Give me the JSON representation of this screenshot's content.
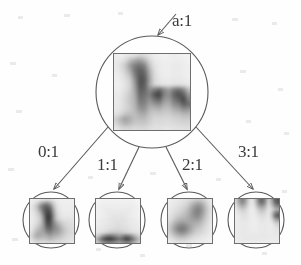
{
  "figure": {
    "type": "tree-diagram",
    "background_color": "#fefefe",
    "ink_color": "#4a4a4a"
  },
  "root": {
    "id": "root",
    "label": "a:1",
    "label_x": 172,
    "label_y": 12,
    "center_x": 152,
    "center_y": 92,
    "radius": 56,
    "patch": {
      "x": 113,
      "y": 53,
      "size": 78,
      "cells": 16,
      "values": [
        [
          12,
          10,
          14,
          18,
          22,
          30,
          26,
          18,
          12,
          10,
          8,
          10,
          12,
          10,
          8,
          8
        ],
        [
          14,
          16,
          26,
          48,
          64,
          72,
          55,
          30,
          16,
          12,
          10,
          10,
          12,
          12,
          10,
          8
        ],
        [
          16,
          22,
          40,
          72,
          96,
          104,
          88,
          44,
          20,
          14,
          12,
          12,
          14,
          14,
          12,
          10
        ],
        [
          14,
          20,
          36,
          66,
          104,
          120,
          106,
          58,
          24,
          14,
          12,
          12,
          14,
          14,
          12,
          10
        ],
        [
          12,
          16,
          28,
          50,
          96,
          126,
          118,
          66,
          28,
          16,
          12,
          12,
          14,
          14,
          12,
          10
        ],
        [
          10,
          14,
          22,
          38,
          84,
          130,
          124,
          70,
          30,
          18,
          14,
          14,
          16,
          16,
          14,
          12
        ],
        [
          10,
          12,
          20,
          34,
          76,
          128,
          120,
          68,
          34,
          26,
          22,
          20,
          24,
          26,
          22,
          16
        ],
        [
          12,
          14,
          22,
          36,
          70,
          120,
          116,
          86,
          96,
          110,
          86,
          72,
          96,
          104,
          86,
          48
        ],
        [
          14,
          16,
          26,
          40,
          66,
          112,
          108,
          96,
          128,
          140,
          96,
          84,
          116,
          132,
          118,
          76
        ],
        [
          14,
          18,
          28,
          42,
          62,
          104,
          100,
          84,
          108,
          118,
          82,
          76,
          104,
          120,
          136,
          96
        ],
        [
          14,
          18,
          28,
          40,
          58,
          92,
          92,
          70,
          78,
          84,
          64,
          62,
          84,
          96,
          120,
          108
        ],
        [
          16,
          20,
          30,
          40,
          54,
          78,
          80,
          56,
          54,
          58,
          48,
          48,
          62,
          70,
          86,
          80
        ],
        [
          20,
          28,
          44,
          48,
          50,
          62,
          64,
          46,
          38,
          40,
          36,
          36,
          44,
          48,
          56,
          54
        ],
        [
          34,
          52,
          68,
          60,
          48,
          50,
          50,
          38,
          30,
          30,
          28,
          28,
          32,
          34,
          38,
          38
        ],
        [
          28,
          44,
          56,
          50,
          40,
          40,
          40,
          32,
          26,
          26,
          24,
          24,
          26,
          28,
          30,
          30
        ],
        [
          16,
          24,
          30,
          30,
          26,
          28,
          28,
          24,
          20,
          20,
          18,
          18,
          20,
          20,
          22,
          22
        ]
      ]
    }
  },
  "children": [
    {
      "id": "child-0",
      "edge_label": "0:1",
      "edge_label_x": 38,
      "edge_label_y": 143,
      "center_x": 51,
      "center_y": 220,
      "radius": 28,
      "patch": {
        "x": 29,
        "y": 198,
        "size": 46,
        "cells": 14,
        "values": [
          [
            10,
            12,
            14,
            18,
            22,
            26,
            22,
            16,
            12,
            10,
            10,
            10,
            10,
            10
          ],
          [
            12,
            18,
            32,
            52,
            70,
            78,
            60,
            34,
            18,
            12,
            10,
            10,
            10,
            10
          ],
          [
            14,
            26,
            48,
            84,
            110,
            118,
            96,
            50,
            22,
            14,
            12,
            12,
            12,
            12
          ],
          [
            14,
            24,
            44,
            80,
            116,
            132,
            118,
            64,
            26,
            16,
            12,
            12,
            12,
            12
          ],
          [
            12,
            20,
            34,
            62,
            108,
            140,
            132,
            74,
            32,
            18,
            14,
            14,
            14,
            14
          ],
          [
            12,
            18,
            28,
            48,
            96,
            146,
            140,
            82,
            36,
            20,
            16,
            16,
            16,
            16
          ],
          [
            12,
            16,
            26,
            42,
            88,
            144,
            138,
            84,
            42,
            28,
            22,
            20,
            20,
            18
          ],
          [
            12,
            18,
            28,
            44,
            84,
            136,
            132,
            92,
            62,
            44,
            32,
            26,
            24,
            20
          ],
          [
            14,
            22,
            36,
            52,
            82,
            124,
            124,
            96,
            76,
            56,
            40,
            30,
            26,
            22
          ],
          [
            16,
            28,
            46,
            60,
            78,
            108,
            112,
            92,
            80,
            64,
            46,
            34,
            28,
            24
          ],
          [
            20,
            38,
            58,
            64,
            70,
            88,
            94,
            80,
            72,
            60,
            46,
            34,
            28,
            24
          ],
          [
            26,
            46,
            62,
            60,
            58,
            66,
            72,
            62,
            56,
            48,
            38,
            30,
            26,
            22
          ],
          [
            22,
            36,
            46,
            46,
            44,
            48,
            52,
            46,
            40,
            36,
            30,
            26,
            22,
            20
          ],
          [
            14,
            20,
            26,
            26,
            26,
            28,
            30,
            28,
            26,
            24,
            22,
            20,
            18,
            16
          ]
        ]
      }
    },
    {
      "id": "child-1",
      "edge_label": "1:1",
      "edge_label_x": 97,
      "edge_label_y": 156,
      "center_x": 117,
      "center_y": 220,
      "radius": 28,
      "patch": {
        "x": 95,
        "y": 198,
        "size": 46,
        "cells": 14,
        "values": [
          [
            6,
            6,
            8,
            8,
            8,
            8,
            8,
            8,
            8,
            8,
            8,
            8,
            6,
            6
          ],
          [
            6,
            8,
            10,
            10,
            10,
            10,
            10,
            10,
            10,
            10,
            10,
            10,
            8,
            6
          ],
          [
            8,
            10,
            12,
            12,
            12,
            12,
            12,
            12,
            12,
            12,
            12,
            12,
            10,
            8
          ],
          [
            8,
            10,
            12,
            14,
            14,
            14,
            14,
            14,
            14,
            14,
            14,
            12,
            10,
            8
          ],
          [
            8,
            10,
            12,
            14,
            16,
            16,
            16,
            16,
            16,
            16,
            14,
            12,
            10,
            8
          ],
          [
            8,
            10,
            12,
            14,
            16,
            18,
            18,
            18,
            18,
            16,
            14,
            12,
            10,
            8
          ],
          [
            10,
            12,
            14,
            16,
            18,
            20,
            20,
            20,
            20,
            18,
            16,
            14,
            12,
            10
          ],
          [
            10,
            12,
            14,
            16,
            18,
            20,
            22,
            22,
            20,
            18,
            16,
            14,
            12,
            10
          ],
          [
            12,
            14,
            16,
            18,
            20,
            22,
            24,
            24,
            22,
            20,
            18,
            16,
            14,
            12
          ],
          [
            14,
            16,
            18,
            20,
            24,
            26,
            28,
            28,
            26,
            24,
            20,
            18,
            16,
            14
          ],
          [
            18,
            22,
            28,
            34,
            40,
            44,
            44,
            42,
            38,
            34,
            30,
            26,
            22,
            18
          ],
          [
            34,
            52,
            78,
            96,
            104,
            98,
            86,
            76,
            88,
            100,
            92,
            70,
            48,
            32
          ],
          [
            56,
            88,
            120,
            140,
            146,
            136,
            118,
            106,
            120,
            138,
            130,
            102,
            72,
            48
          ],
          [
            40,
            62,
            84,
            96,
            100,
            94,
            84,
            76,
            84,
            96,
            90,
            72,
            52,
            34
          ]
        ]
      }
    },
    {
      "id": "child-2",
      "edge_label": "2:1",
      "edge_label_x": 182,
      "edge_label_y": 156,
      "center_x": 189,
      "center_y": 220,
      "radius": 28,
      "patch": {
        "x": 167,
        "y": 198,
        "size": 46,
        "cells": 14,
        "values": [
          [
            10,
            12,
            14,
            16,
            18,
            20,
            24,
            30,
            36,
            40,
            38,
            30,
            20,
            14
          ],
          [
            12,
            14,
            16,
            18,
            22,
            26,
            34,
            46,
            58,
            64,
            58,
            42,
            26,
            16
          ],
          [
            12,
            16,
            18,
            22,
            26,
            32,
            44,
            60,
            76,
            84,
            74,
            52,
            32,
            18
          ],
          [
            14,
            18,
            22,
            26,
            32,
            40,
            52,
            70,
            86,
            94,
            82,
            58,
            36,
            20
          ],
          [
            16,
            20,
            26,
            32,
            38,
            46,
            58,
            74,
            88,
            94,
            80,
            56,
            34,
            20
          ],
          [
            18,
            24,
            32,
            40,
            46,
            52,
            62,
            74,
            84,
            86,
            72,
            50,
            32,
            18
          ],
          [
            22,
            30,
            42,
            52,
            58,
            60,
            64,
            70,
            74,
            74,
            62,
            44,
            28,
            18
          ],
          [
            28,
            40,
            56,
            68,
            74,
            72,
            68,
            66,
            64,
            60,
            50,
            36,
            24,
            16
          ],
          [
            34,
            50,
            70,
            86,
            92,
            88,
            76,
            66,
            56,
            50,
            42,
            30,
            22,
            14
          ],
          [
            36,
            54,
            76,
            94,
            100,
            94,
            78,
            62,
            48,
            40,
            34,
            26,
            20,
            14
          ],
          [
            32,
            46,
            64,
            80,
            86,
            80,
            66,
            52,
            40,
            32,
            28,
            22,
            18,
            12
          ],
          [
            24,
            34,
            46,
            56,
            60,
            56,
            46,
            36,
            28,
            24,
            20,
            18,
            14,
            12
          ],
          [
            16,
            22,
            30,
            36,
            38,
            36,
            30,
            24,
            20,
            18,
            16,
            14,
            12,
            10
          ],
          [
            10,
            14,
            18,
            20,
            22,
            20,
            18,
            16,
            14,
            12,
            12,
            10,
            10,
            8
          ]
        ]
      }
    },
    {
      "id": "child-3",
      "edge_label": "3:1",
      "edge_label_x": 238,
      "edge_label_y": 143,
      "center_x": 256,
      "center_y": 220,
      "radius": 28,
      "patch": {
        "x": 234,
        "y": 198,
        "size": 46,
        "cells": 14,
        "values": [
          [
            34,
            72,
            96,
            74,
            34,
            18,
            46,
            96,
            118,
            90,
            40,
            70,
            120,
            132
          ],
          [
            30,
            62,
            86,
            66,
            30,
            16,
            40,
            86,
            106,
            80,
            34,
            60,
            108,
            124
          ],
          [
            22,
            44,
            60,
            48,
            24,
            14,
            30,
            62,
            76,
            58,
            26,
            44,
            80,
            96
          ],
          [
            16,
            28,
            38,
            32,
            18,
            12,
            20,
            40,
            50,
            40,
            20,
            30,
            56,
            70
          ],
          [
            14,
            20,
            26,
            24,
            16,
            12,
            16,
            28,
            34,
            28,
            18,
            40,
            90,
            110
          ],
          [
            12,
            16,
            20,
            20,
            16,
            12,
            14,
            20,
            24,
            22,
            16,
            44,
            104,
            126
          ],
          [
            12,
            14,
            18,
            18,
            14,
            12,
            12,
            16,
            20,
            18,
            14,
            30,
            68,
            84
          ],
          [
            12,
            14,
            16,
            16,
            14,
            12,
            12,
            14,
            16,
            16,
            14,
            18,
            36,
            46
          ],
          [
            12,
            14,
            16,
            16,
            14,
            12,
            12,
            14,
            16,
            16,
            14,
            14,
            22,
            28
          ],
          [
            12,
            14,
            16,
            16,
            14,
            12,
            12,
            14,
            16,
            16,
            14,
            14,
            18,
            20
          ],
          [
            12,
            14,
            16,
            16,
            14,
            14,
            14,
            14,
            16,
            16,
            14,
            14,
            16,
            18
          ],
          [
            12,
            14,
            16,
            16,
            16,
            16,
            16,
            16,
            16,
            16,
            16,
            14,
            16,
            16
          ],
          [
            12,
            14,
            14,
            16,
            16,
            16,
            16,
            16,
            16,
            16,
            14,
            14,
            14,
            14
          ],
          [
            10,
            12,
            12,
            12,
            12,
            12,
            12,
            12,
            12,
            12,
            12,
            12,
            12,
            12
          ]
        ]
      }
    }
  ]
}
